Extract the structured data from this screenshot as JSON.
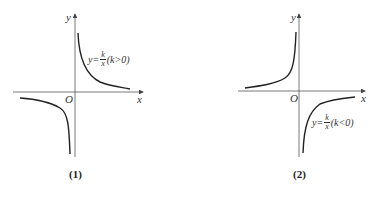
{
  "panels": [
    {
      "caption": "(1)",
      "axis_x_label": "x",
      "axis_y_label": "y",
      "origin_label": "O",
      "equation": {
        "lhs": "y=",
        "num": "k",
        "den": "x",
        "cond": "(k>0)"
      },
      "curve_color": "#222222",
      "quadrants": [
        "I",
        "III"
      ]
    },
    {
      "caption": "(2)",
      "axis_x_label": "x",
      "axis_y_label": "y",
      "origin_label": "O",
      "equation": {
        "lhs": "y=",
        "num": "k",
        "den": "x",
        "cond": "(k<0)"
      },
      "curve_color": "#222222",
      "quadrants": [
        "II",
        "IV"
      ]
    }
  ]
}
